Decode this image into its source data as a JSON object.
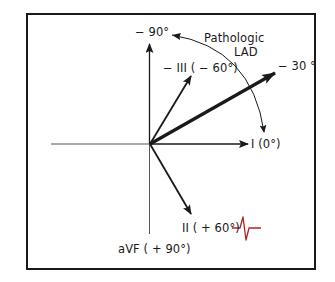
{
  "diagram": {
    "type": "hexaxial-reference",
    "colors": {
      "line": "#1a1a1a",
      "axis_thin": "#555555",
      "ecg_trace": "#b22222"
    },
    "labels": {
      "minus90": "− 90°",
      "pathologic_line1": "Pathologic",
      "pathologic_line2": "LAD",
      "lead_minus3": "− III ( − 60°)",
      "minus30": "− 30 °",
      "lead1": "I (0°)",
      "lead2": "II ( + 60°)",
      "aVF": "aVF ( + 90°)"
    },
    "vectors": [
      {
        "name": "lead-I",
        "angle_deg": 0,
        "label": "I (0°)"
      },
      {
        "name": "minus-30",
        "angle_deg": -30,
        "label": "− 30 °",
        "emphasis": "bold"
      },
      {
        "name": "lead-minus-III",
        "angle_deg": -60,
        "label": "− III ( − 60°)"
      },
      {
        "name": "minus-90",
        "angle_deg": -90,
        "label": "− 90°"
      },
      {
        "name": "lead-II",
        "angle_deg": 60,
        "label": "II ( + 60°)"
      },
      {
        "name": "aVF",
        "angle_deg": 90,
        "label": "aVF ( + 90°)"
      }
    ],
    "arc": {
      "from_deg": -90,
      "to_deg": 0,
      "label": "Pathologic LAD"
    }
  }
}
